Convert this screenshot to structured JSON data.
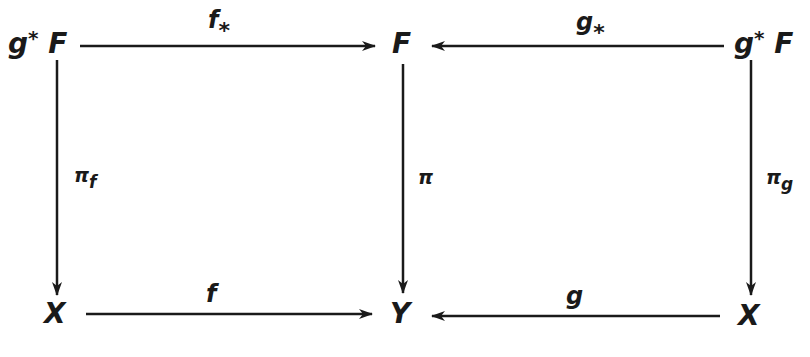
{
  "diagram": {
    "type": "commutative-diagram",
    "nodes": {
      "top_left": {
        "base": "g",
        "sup": "*",
        "tail": " F"
      },
      "top_mid": {
        "text": "F"
      },
      "top_right": {
        "base": "g",
        "sup": "*",
        "tail": " F"
      },
      "bot_left": {
        "text": "X"
      },
      "bot_mid": {
        "text": "Y"
      },
      "bot_right": {
        "text": "X"
      }
    },
    "arrows": {
      "top_left_to_mid": {
        "base": "f",
        "sub": "*",
        "direction": "right"
      },
      "top_right_to_mid": {
        "base": "g",
        "sub": "*",
        "direction": "left"
      },
      "left_vertical": {
        "base": "π",
        "sub": "f",
        "direction": "down"
      },
      "mid_vertical": {
        "base": "π",
        "direction": "down"
      },
      "right_vertical": {
        "base": "π",
        "sub": "g",
        "direction": "down"
      },
      "bot_left_to_mid": {
        "base": "f",
        "direction": "right"
      },
      "bot_right_to_mid": {
        "base": "g",
        "direction": "left"
      }
    },
    "stroke_color": "#1a1a1a",
    "background": "#ffffff"
  }
}
